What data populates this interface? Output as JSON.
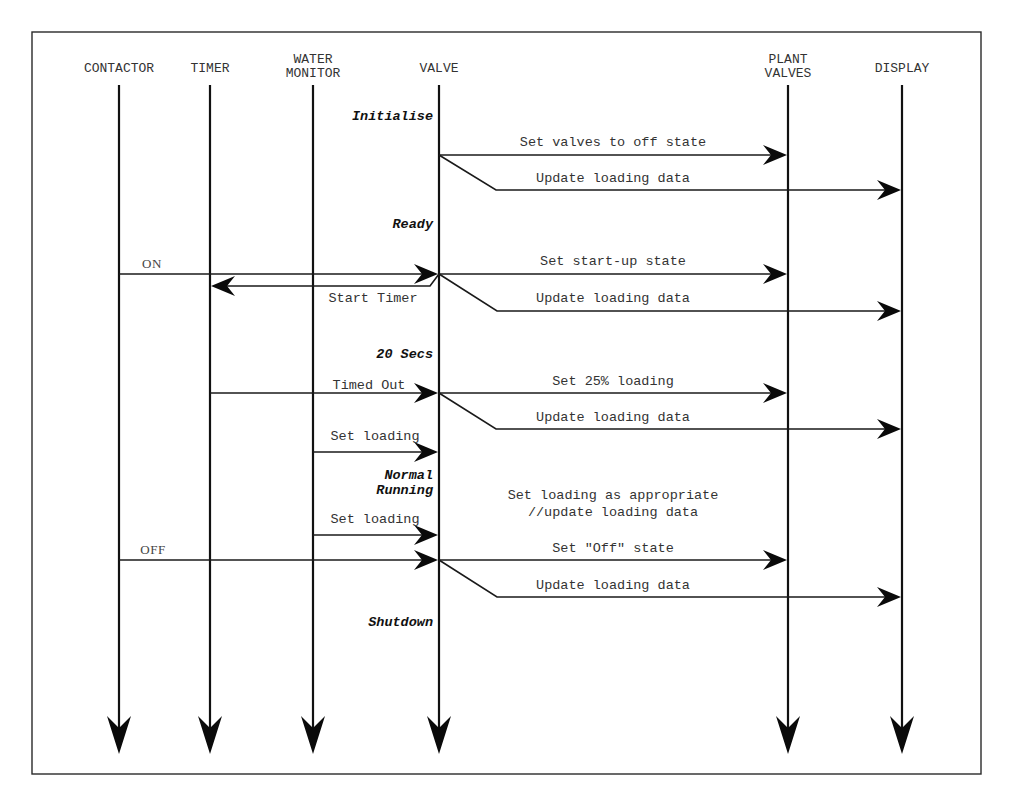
{
  "diagram": {
    "type": "sequence-diagram",
    "frame": {
      "x": 32,
      "y": 32,
      "width": 949,
      "height": 742
    },
    "lifeline_top": 85,
    "lifeline_bottom": 754,
    "participants": [
      {
        "id": "contactor",
        "lines": [
          "CONTACTOR"
        ],
        "x": 119
      },
      {
        "id": "timer",
        "lines": [
          "TIMER"
        ],
        "x": 210
      },
      {
        "id": "water-monitor",
        "lines": [
          "WATER",
          "MONITOR"
        ],
        "x": 313
      },
      {
        "id": "valve",
        "lines": [
          "VALVE"
        ],
        "x": 439
      },
      {
        "id": "plant-valves",
        "lines": [
          "PLANT",
          "VALVES"
        ],
        "x": 788
      },
      {
        "id": "display",
        "lines": [
          "DISPLAY"
        ],
        "x": 902
      }
    ],
    "states": [
      {
        "id": "initialise",
        "lines": [
          "Initialise"
        ],
        "y": 120
      },
      {
        "id": "ready",
        "lines": [
          "Ready"
        ],
        "y": 228
      },
      {
        "id": "20-secs",
        "lines": [
          "20 Secs"
        ],
        "y": 358
      },
      {
        "id": "normal-running",
        "lines": [
          "Normal",
          "Running"
        ],
        "y": 479
      },
      {
        "id": "shutdown",
        "lines": [
          "Shutdown"
        ],
        "y": 626
      }
    ],
    "messages": [
      {
        "id": "set-valves-off",
        "label": "Set valves to off state",
        "from": "valve",
        "to": "plant-valves",
        "y": 155,
        "label_y": 146,
        "label_x": 613
      },
      {
        "id": "update-loading-1",
        "label": "Update loading data",
        "from": "valve",
        "to": "display",
        "y0": 155,
        "y": 190,
        "bend_x": 496,
        "label_y": 182,
        "label_x": 613
      },
      {
        "id": "on",
        "label": "ON",
        "from": "contactor",
        "to": "valve",
        "y": 274,
        "label_y": 268,
        "label_x": 152,
        "serif": true
      },
      {
        "id": "start-timer",
        "label": "Start Timer",
        "from": "valve",
        "to": "timer",
        "y0": 274,
        "y": 286,
        "bend_x": 430,
        "label_y": 302,
        "label_x": 373
      },
      {
        "id": "set-start-up",
        "label": "Set start-up state",
        "from": "valve",
        "to": "plant-valves",
        "y": 274,
        "label_y": 265,
        "label_x": 613
      },
      {
        "id": "update-loading-2",
        "label": "Update loading data",
        "from": "valve",
        "to": "display",
        "y0": 274,
        "y": 311,
        "bend_x": 497,
        "label_y": 302,
        "label_x": 613
      },
      {
        "id": "timed-out",
        "label": "Timed Out",
        "from": "timer",
        "to": "valve",
        "y": 393,
        "label_y": 389,
        "label_x": 369
      },
      {
        "id": "set-25-loading",
        "label": "Set 25% loading",
        "from": "valve",
        "to": "plant-valves",
        "y": 393,
        "label_y": 385,
        "label_x": 613
      },
      {
        "id": "update-loading-3",
        "label": "Update loading data",
        "from": "valve",
        "to": "display",
        "y0": 393,
        "y": 429,
        "bend_x": 496,
        "label_y": 421,
        "label_x": 613
      },
      {
        "id": "set-loading-1",
        "label": "Set loading",
        "from": "water-monitor",
        "to": "valve",
        "y": 452,
        "label_y": 440,
        "label_x": 375
      },
      {
        "id": "set-loading-2",
        "label": "Set loading",
        "from": "water-monitor",
        "to": "valve",
        "y": 535,
        "label_y": 523,
        "label_x": 375
      },
      {
        "id": "off",
        "label": "OFF",
        "from": "contactor",
        "to": "valve",
        "y": 560,
        "label_y": 554,
        "label_x": 153,
        "serif": true
      },
      {
        "id": "set-off-state",
        "label": "Set \"Off\" state",
        "from": "valve",
        "to": "plant-valves",
        "y": 560,
        "label_y": 552,
        "label_x": 613
      },
      {
        "id": "update-loading-4",
        "label": "Update loading data",
        "from": "valve",
        "to": "display",
        "y0": 560,
        "y": 597,
        "bend_x": 497,
        "label_y": 589,
        "label_x": 613
      }
    ],
    "notes": [
      {
        "id": "normal-running-note",
        "lines": [
          "Set loading as appropriate",
          "//update loading data"
        ],
        "x": 613,
        "y": 499
      }
    ]
  }
}
